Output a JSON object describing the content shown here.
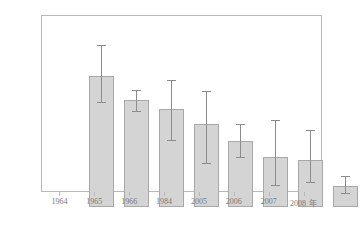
{
  "chart_data": {
    "type": "bar",
    "title": "",
    "xlabel": "",
    "ylabel": "全氮浓度(mg/L)",
    "xunit": "年",
    "categories": [
      "1964",
      "1965",
      "1966",
      "1984",
      "2005",
      "2006",
      "2007",
      "2008"
    ],
    "values": [
      1.05,
      0.855,
      0.785,
      0.665,
      0.525,
      0.4,
      0.375,
      0.165
    ],
    "error_low": [
      0.84,
      0.77,
      0.54,
      0.35,
      0.4,
      0.18,
      0.2,
      0.115
    ],
    "error_high": [
      1.3,
      0.94,
      1.02,
      0.93,
      0.665,
      0.7,
      0.615,
      0.245
    ],
    "ylim": [
      0.0,
      1.4
    ],
    "ytick_labels": [
      "0.0",
      "0.2",
      "0.4",
      "0.6",
      "0.8",
      "1.0",
      "1.2",
      "1.4"
    ],
    "ytick_values": [
      0.0,
      0.2,
      0.4,
      0.6,
      0.8,
      1.0,
      1.2,
      1.4
    ],
    "grid": false,
    "legend": null,
    "bar_color": "#d4d4d4",
    "bar_edge_color": "#a8a8a8",
    "error_color": "#8c8c8c",
    "axis_color": "#b9b9b9",
    "text_color": "#7a7a7a"
  }
}
